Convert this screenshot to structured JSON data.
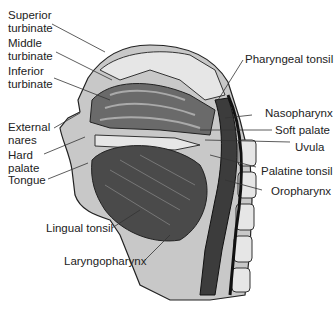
{
  "labels": {
    "superior_turbinate": "Superior\nturbinate",
    "middle_turbinate": "Middle\nturbinate",
    "inferior_turbinate": "Inferior\nturbinate",
    "external_nares": "External\nnares",
    "hard_palate": "Hard\npalate",
    "tongue": "Tongue",
    "lingual_tonsil": "Lingual tonsil",
    "laryngopharynx": "Laryngopharynx",
    "pharyngeal_tonsil": "Pharyngeal tonsil",
    "nasopharynx": "Nasopharynx",
    "soft_palate": "Soft palate",
    "uvula": "Uvula",
    "palatine_tonsil": "Palatine tonsil",
    "oropharynx": "Oropharynx"
  },
  "colors": {
    "tissue_dark": "#4a4a4a",
    "tissue_mid": "#8a8a8a",
    "tissue_light": "#c8c8c8",
    "bone": "#e6e6e6",
    "outline": "#222222"
  }
}
